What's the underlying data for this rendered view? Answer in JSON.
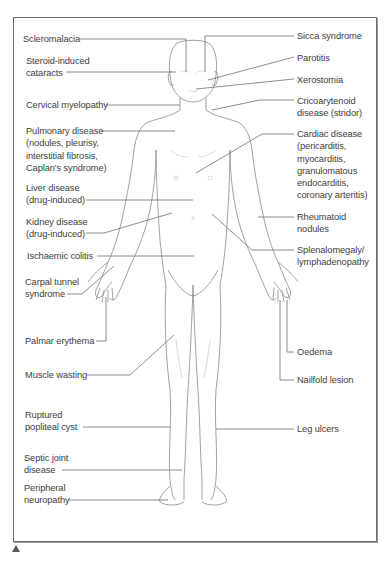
{
  "figure": {
    "title_marker": "triangle-up",
    "labels_left": [
      {
        "id": "scleromalacia",
        "text": "Scleromalacia"
      },
      {
        "id": "steroid_cataracts",
        "text": "Steroid-induced\ncataracts"
      },
      {
        "id": "cervical_myelopathy",
        "text": "Cervical myelopathy"
      },
      {
        "id": "pulmonary_disease",
        "text": "Pulmonary disease\n(nodules, pleurisy,\ninterstitial fibrosis,\nCaplan's syndrome)"
      },
      {
        "id": "liver_disease",
        "text": "Liver disease\n(drug-induced)"
      },
      {
        "id": "kidney_disease",
        "text": "Kidney disease\n(drug-induced)"
      },
      {
        "id": "ischaemic_colitis",
        "text": "Ischaemic colitis"
      },
      {
        "id": "carpal_tunnel",
        "text": "Carpal tunnel\nsyndrome"
      },
      {
        "id": "palmar_erythema",
        "text": "Palmar erythema"
      },
      {
        "id": "muscle_wasting",
        "text": "Muscle wasting"
      },
      {
        "id": "popliteal_cyst",
        "text": "Ruptured\npopliteal cyst"
      },
      {
        "id": "septic_joint",
        "text": "Septic joint\ndisease"
      },
      {
        "id": "peripheral_neuropathy",
        "text": "Peripheral\nneuropathy"
      }
    ],
    "labels_right": [
      {
        "id": "sicca_syndrome",
        "text": "Sicca syndrome"
      },
      {
        "id": "parotitis",
        "text": "Parotitis"
      },
      {
        "id": "xerostomia",
        "text": "Xerostomia"
      },
      {
        "id": "cricoarytenoid",
        "text": "Cricoarytenoid\ndisease (stridor)"
      },
      {
        "id": "cardiac_disease",
        "text": "Cardiac disease\n(pericarditis,\nmyocarditis,\ngranulomatous\nendocarditis,\ncoronary arteritis)"
      },
      {
        "id": "rheumatoid_nodules",
        "text": "Rheumatoid\nnodules"
      },
      {
        "id": "splenomegaly",
        "text": "Splenalomegaly/\nlymphadenopathy"
      },
      {
        "id": "oedema",
        "text": "Oedema"
      },
      {
        "id": "nailfold_lesion",
        "text": "Nailfold lesion"
      },
      {
        "id": "leg_ulcers",
        "text": "Leg ulcers"
      }
    ]
  },
  "colors": {
    "frame": "#6b6b6b",
    "text": "#3d3d3d",
    "leader": "#707070",
    "body_outline": "#8a8a8a",
    "body_detail": "#c8c8c8"
  }
}
